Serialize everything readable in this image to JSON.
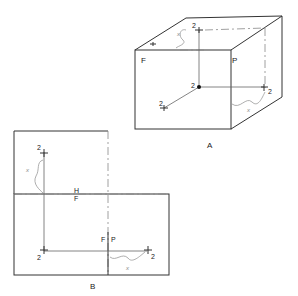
{
  "figure_a": {
    "caption": "A",
    "face_labels": {
      "front": "F",
      "profile": "P"
    },
    "point_labels": {
      "top": "2",
      "center": "2",
      "left": "2",
      "right": "2"
    },
    "distance_labels": {
      "top": "x",
      "right": "x"
    }
  },
  "figure_b": {
    "caption": "B",
    "fold_labels": {
      "h": "H",
      "f": "F",
      "fp_f": "F",
      "fp_p": "P"
    },
    "point_labels": {
      "top": "2",
      "bottom_left": "2",
      "bottom_right": "2"
    },
    "distance_labels": {
      "top": "x",
      "bottom": "x"
    }
  }
}
